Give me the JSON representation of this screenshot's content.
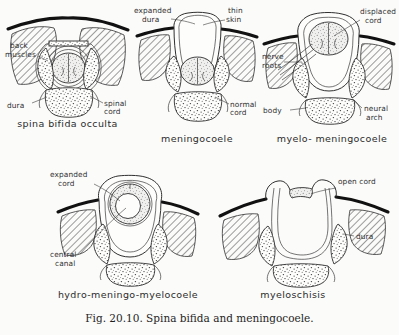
{
  "figure": {
    "caption": "Fig. 20.10. Spina bifida and meningocoele.",
    "panels": [
      {
        "id": "spina-bifida-occulta",
        "title": "spina bifida occulta",
        "labels": [
          {
            "name": "back-muscles",
            "text_line1": "back",
            "text_line2": "muscles"
          },
          {
            "name": "dura",
            "text_line1": "dura",
            "text_line2": ""
          },
          {
            "name": "spinal-cord",
            "text_line1": "spinal",
            "text_line2": "cord"
          }
        ]
      },
      {
        "id": "meningocoele",
        "title": "meningocoele",
        "labels": [
          {
            "name": "expanded-dura",
            "text_line1": "expanded",
            "text_line2": "dura"
          },
          {
            "name": "thin-skin",
            "text_line1": "thin",
            "text_line2": "skin"
          },
          {
            "name": "normal-cord",
            "text_line1": "normal",
            "text_line2": "cord"
          }
        ]
      },
      {
        "id": "myelo-meningocoele",
        "title": "myelo- meningocoele",
        "labels": [
          {
            "name": "displaced-cord",
            "text_line1": "displaced",
            "text_line2": "cord"
          },
          {
            "name": "nerve-roots",
            "text_line1": "nerve",
            "text_line2": "roots"
          },
          {
            "name": "vertebral-body",
            "text_line1": "body",
            "text_line2": ""
          },
          {
            "name": "neural-arch",
            "text_line1": "neural",
            "text_line2": "arch"
          }
        ]
      },
      {
        "id": "hydro-meningo-myelocoele",
        "title": "hydro-meningo-myelocoele",
        "labels": [
          {
            "name": "expanded-cord",
            "text_line1": "expanded",
            "text_line2": "cord"
          },
          {
            "name": "central-canal",
            "text_line1": "central",
            "text_line2": "canal"
          }
        ]
      },
      {
        "id": "myeloschisis",
        "title": "myeloschisis",
        "labels": [
          {
            "name": "open-cord",
            "text_line1": "open cord",
            "text_line2": ""
          },
          {
            "name": "dura",
            "text_line1": "dura",
            "text_line2": ""
          }
        ]
      }
    ]
  },
  "colors": {
    "ink": "#2f2f2f",
    "skin_line": "#111111",
    "background": "#fbfbfa"
  }
}
